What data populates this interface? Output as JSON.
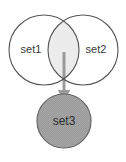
{
  "diagram": {
    "type": "venn-with-arrow",
    "title": "",
    "background_color": "#ffffff",
    "nodes": [
      {
        "id": "set1",
        "label": "set1",
        "shape": "circle",
        "cx": 44,
        "cy": 50,
        "r": 35,
        "fill": "none",
        "stroke": "#555555",
        "stroke_width": 1.1,
        "label_x": 31,
        "label_y": 50
      },
      {
        "id": "set2",
        "label": "set2",
        "shape": "circle",
        "cx": 83,
        "cy": 50,
        "r": 35,
        "fill": "none",
        "stroke": "#555555",
        "stroke_width": 1.1,
        "label_x": 96,
        "label_y": 50
      },
      {
        "id": "set3",
        "label": "set3",
        "shape": "circle",
        "cx": 64,
        "cy": 121,
        "r": 27,
        "fill": "#9a9a9a",
        "stroke": "#666666",
        "stroke_width": 1.2,
        "label_x": 64,
        "label_y": 122
      }
    ],
    "intersection": {
      "id": "set1-set2-intersection",
      "fill": "#ececec",
      "stroke": "#8c8c8c"
    },
    "edges": [
      {
        "id": "intersection-to-set3",
        "from": "set1-set2-intersection",
        "to": "set3",
        "label": "",
        "color": "#9a9a9a",
        "stroke_width": 3,
        "x": 64,
        "y_start": 52,
        "y_end": 99,
        "arrowhead": "filled-triangle"
      }
    ],
    "colors": {
      "outline": "#555555",
      "lens_fill": "#ececec",
      "set3_fill": "#9a9a9a",
      "arrow": "#9a9a9a",
      "text": "#3a3a3a"
    }
  }
}
